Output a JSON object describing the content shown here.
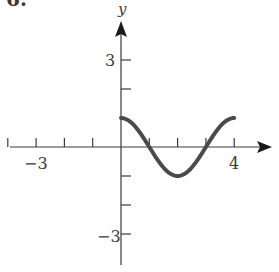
{
  "figure": {
    "problem_number": "6.",
    "y_axis_label": "y"
  },
  "chart_data": {
    "type": "line",
    "title": "",
    "xlabel": "",
    "ylabel": "y",
    "xlim": [
      -4,
      5
    ],
    "ylim": [
      -4,
      4
    ],
    "x_ticks": [
      -4,
      -3,
      -2,
      -1,
      1,
      2,
      3,
      4
    ],
    "y_ticks": [
      -3,
      -2,
      -1,
      2,
      3
    ],
    "x_tick_labels": [
      {
        "value": -3,
        "label": "−3"
      },
      {
        "value": 4,
        "label": "4"
      }
    ],
    "y_tick_labels": [
      {
        "value": 3,
        "label": "3"
      },
      {
        "value": -3,
        "label": "−3"
      }
    ],
    "grid": false,
    "legend": null,
    "series": [
      {
        "name": "y = cos(πx/2)",
        "x": [
          0,
          0.5,
          1,
          1.5,
          2,
          2.5,
          3,
          3.5,
          4
        ],
        "values": [
          1,
          0.707,
          0,
          -0.707,
          -1,
          -0.707,
          0,
          0.707,
          1
        ],
        "color": "#4a4a4a"
      }
    ]
  }
}
